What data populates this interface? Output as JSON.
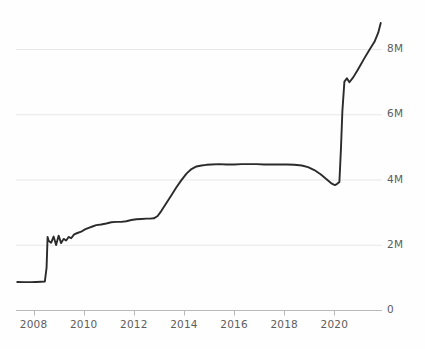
{
  "chart_data": {
    "type": "line",
    "title": "",
    "subtitle": "",
    "xlabel": "",
    "ylabel": "",
    "grid": true,
    "legend": null,
    "y_axis_position": "right",
    "xlim": [
      2007.3,
      2021.9
    ],
    "ylim": [
      0,
      9500000
    ],
    "x_tick_labels": [
      "2008",
      "2010",
      "2012",
      "2014",
      "2016",
      "2018",
      "2020"
    ],
    "x_ticks": [
      2008,
      2010,
      2012,
      2014,
      2016,
      2018,
      2020
    ],
    "y_tick_labels": [
      "0",
      "2M",
      "4M",
      "6M",
      "8M"
    ],
    "y_ticks": [
      0,
      2000000,
      4000000,
      6000000,
      8000000
    ],
    "line_color": "#2b2b2b",
    "grid_color": "#e8e8e8",
    "axis_color": "#b9b9b9",
    "tick_label_color": "#5d5d5d",
    "series": [
      {
        "name": "value",
        "x": [
          2007.35,
          2007.6,
          2007.9,
          2008.1,
          2008.3,
          2008.45,
          2008.52,
          2008.56,
          2008.6,
          2008.7,
          2008.8,
          2008.9,
          2009.0,
          2009.1,
          2009.2,
          2009.3,
          2009.4,
          2009.5,
          2009.62,
          2009.75,
          2009.9,
          2010.05,
          2010.2,
          2010.35,
          2010.5,
          2010.7,
          2010.9,
          2011.1,
          2011.3,
          2011.5,
          2011.7,
          2011.9,
          2012.1,
          2012.3,
          2012.5,
          2012.65,
          2012.8,
          2012.95,
          2013.1,
          2013.3,
          2013.5,
          2013.7,
          2013.9,
          2014.1,
          2014.3,
          2014.5,
          2014.7,
          2014.9,
          2015.1,
          2015.4,
          2015.7,
          2016.0,
          2016.3,
          2016.6,
          2016.9,
          2017.2,
          2017.5,
          2017.8,
          2018.1,
          2018.4,
          2018.7,
          2018.95,
          2019.2,
          2019.45,
          2019.7,
          2019.9,
          2020.02,
          2020.1,
          2020.16,
          2020.2,
          2020.26,
          2020.32,
          2020.4,
          2020.5,
          2020.6,
          2020.75,
          2020.9,
          2021.05,
          2021.2,
          2021.4,
          2021.6,
          2021.75,
          2021.85
        ],
        "y": [
          860000,
          855000,
          855000,
          860000,
          865000,
          870000,
          1300000,
          2240000,
          2120000,
          2060000,
          2250000,
          1990000,
          2280000,
          2050000,
          2180000,
          2130000,
          2240000,
          2200000,
          2320000,
          2360000,
          2400000,
          2470000,
          2520000,
          2560000,
          2600000,
          2620000,
          2650000,
          2690000,
          2700000,
          2700000,
          2720000,
          2760000,
          2780000,
          2790000,
          2800000,
          2800000,
          2810000,
          2880000,
          3040000,
          3280000,
          3520000,
          3760000,
          3980000,
          4180000,
          4320000,
          4400000,
          4430000,
          4450000,
          4460000,
          4470000,
          4460000,
          4460000,
          4470000,
          4470000,
          4470000,
          4460000,
          4460000,
          4460000,
          4460000,
          4450000,
          4430000,
          4380000,
          4290000,
          4160000,
          4000000,
          3870000,
          3830000,
          3860000,
          3900000,
          3920000,
          4900000,
          6100000,
          7000000,
          7100000,
          6980000,
          7130000,
          7320000,
          7520000,
          7720000,
          7980000,
          8220000,
          8500000,
          8800000
        ]
      }
    ]
  },
  "axes": {
    "y_labels": [
      {
        "text": "8M",
        "value": 8000000
      },
      {
        "text": "6M",
        "value": 6000000
      },
      {
        "text": "4M",
        "value": 4000000
      },
      {
        "text": "2M",
        "value": 2000000
      },
      {
        "text": "0",
        "value": 0
      }
    ],
    "x_labels": [
      {
        "text": "2008",
        "value": 2008
      },
      {
        "text": "2010",
        "value": 2010
      },
      {
        "text": "2012",
        "value": 2012
      },
      {
        "text": "2014",
        "value": 2014
      },
      {
        "text": "2016",
        "value": 2016
      },
      {
        "text": "2018",
        "value": 2018
      },
      {
        "text": "2020",
        "value": 2020
      }
    ]
  }
}
